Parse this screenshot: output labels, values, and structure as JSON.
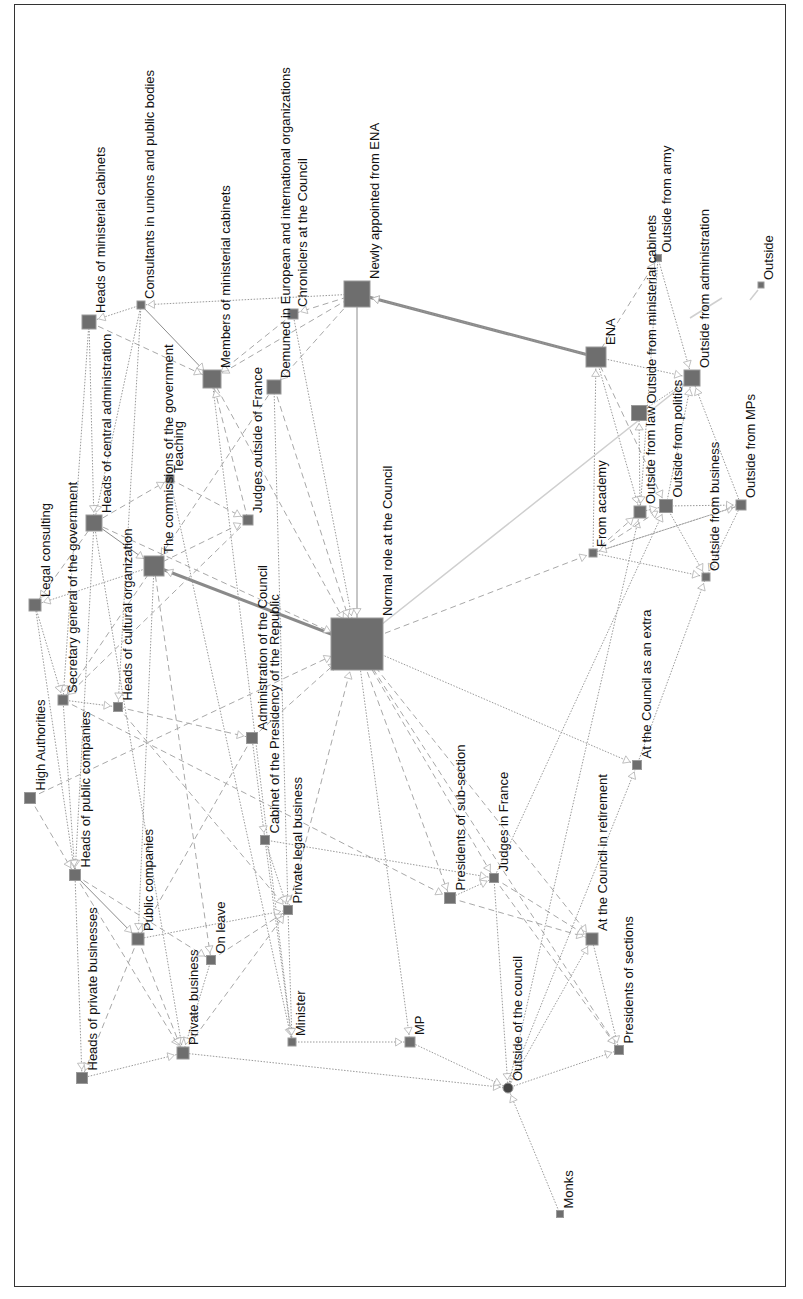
{
  "diagram": {
    "type": "directed-network",
    "orientation": "rotated 90° counter-clockwise (labels read bottom-to-top)",
    "nodes": [
      {
        "id": "normal",
        "label": "Normal role at the Council",
        "x": 357,
        "y": 644,
        "size": 52,
        "shape": "square"
      },
      {
        "id": "newly_ena",
        "label": "Newly appointed from ENA",
        "x": 357,
        "y": 294,
        "size": 26,
        "shape": "square"
      },
      {
        "id": "ena",
        "label": "ENA",
        "x": 596,
        "y": 357,
        "size": 20,
        "shape": "square"
      },
      {
        "id": "chroniclers",
        "label": "Chroniclers at the Council",
        "x": 293,
        "y": 314,
        "size": 10,
        "shape": "square"
      },
      {
        "id": "demuned",
        "label": "Demuned in European and international organizations",
        "x": 274,
        "y": 387,
        "size": 14,
        "shape": "square"
      },
      {
        "id": "members_cab",
        "label": "Members of ministerial cabinets",
        "x": 212,
        "y": 379,
        "size": 18,
        "shape": "square"
      },
      {
        "id": "consultants",
        "label": "Consultants in unions and public bodies",
        "x": 141,
        "y": 305,
        "size": 8,
        "shape": "square"
      },
      {
        "id": "heads_cab",
        "label": "Heads of ministerial cabinets",
        "x": 89,
        "y": 322,
        "size": 14,
        "shape": "square"
      },
      {
        "id": "heads_central",
        "label": "Heads of central administration",
        "x": 94,
        "y": 523,
        "size": 16,
        "shape": "square"
      },
      {
        "id": "commissions",
        "label": "The commissions of the government",
        "x": 154,
        "y": 566,
        "size": 20,
        "shape": "square"
      },
      {
        "id": "teaching",
        "label": "Teaching",
        "x": 170,
        "y": 479,
        "size": 8,
        "shape": "square"
      },
      {
        "id": "judges_out",
        "label": "Judges outside of France",
        "x": 248,
        "y": 520,
        "size": 10,
        "shape": "square"
      },
      {
        "id": "legal",
        "label": "Legal consulting",
        "x": 35,
        "y": 605,
        "size": 12,
        "shape": "square"
      },
      {
        "id": "secgen",
        "label": "Secretary general of the government",
        "x": 63,
        "y": 700,
        "size": 10,
        "shape": "square"
      },
      {
        "id": "cultural",
        "label": "Heads of cultural organization",
        "x": 118,
        "y": 707,
        "size": 9,
        "shape": "square"
      },
      {
        "id": "admin_council",
        "label": "Administration of the Council",
        "x": 252,
        "y": 738,
        "size": 11,
        "shape": "square"
      },
      {
        "id": "cabinet_pres",
        "label": "Cabinet of the Presidency of the Republic",
        "x": 265,
        "y": 840,
        "size": 9,
        "shape": "square"
      },
      {
        "id": "high_auth",
        "label": "High Authorities",
        "x": 30,
        "y": 798,
        "size": 11,
        "shape": "square"
      },
      {
        "id": "heads_public",
        "label": "Heads of public companies",
        "x": 75,
        "y": 875,
        "size": 11,
        "shape": "square"
      },
      {
        "id": "public_comp",
        "label": "Public companies",
        "x": 138,
        "y": 939,
        "size": 12,
        "shape": "square"
      },
      {
        "id": "on_leave",
        "label": "On leave",
        "x": 211,
        "y": 960,
        "size": 9,
        "shape": "square"
      },
      {
        "id": "private_legal",
        "label": "Private legal business",
        "x": 288,
        "y": 910,
        "size": 9,
        "shape": "square"
      },
      {
        "id": "private_bus",
        "label": "Private business",
        "x": 183,
        "y": 1053,
        "size": 12,
        "shape": "square"
      },
      {
        "id": "heads_private",
        "label": "Heads of private businesses",
        "x": 82,
        "y": 1078,
        "size": 11,
        "shape": "square"
      },
      {
        "id": "minister",
        "label": "Minister",
        "x": 292,
        "y": 1042,
        "size": 8,
        "shape": "square"
      },
      {
        "id": "mp",
        "label": "MP",
        "x": 410,
        "y": 1042,
        "size": 10,
        "shape": "square"
      },
      {
        "id": "pres_subsec",
        "label": "Presidents of sub-section",
        "x": 450,
        "y": 898,
        "size": 11,
        "shape": "square"
      },
      {
        "id": "judges_fr",
        "label": "Judges in France",
        "x": 494,
        "y": 878,
        "size": 9,
        "shape": "square"
      },
      {
        "id": "outside_council",
        "label": "Outside of the council",
        "x": 508,
        "y": 1088,
        "size": 10,
        "shape": "circle"
      },
      {
        "id": "monks",
        "label": "Monks",
        "x": 560,
        "y": 1214,
        "size": 7,
        "shape": "square"
      },
      {
        "id": "at_council_ret",
        "label": "At the Council in retirement",
        "x": 592,
        "y": 939,
        "size": 12,
        "shape": "square"
      },
      {
        "id": "pres_sections",
        "label": "Presidents of sections",
        "x": 619,
        "y": 1050,
        "size": 9,
        "shape": "square"
      },
      {
        "id": "at_council_extra",
        "label": "At the Council as an extra",
        "x": 637,
        "y": 765,
        "size": 9,
        "shape": "square"
      },
      {
        "id": "from_academy",
        "label": "From academy",
        "x": 593,
        "y": 553,
        "size": 8,
        "shape": "square"
      },
      {
        "id": "out_law",
        "label": "Outside from law",
        "x": 640,
        "y": 512,
        "size": 12,
        "shape": "square"
      },
      {
        "id": "out_politics",
        "label": "Outside from politics",
        "x": 666,
        "y": 506,
        "size": 13,
        "shape": "square"
      },
      {
        "id": "out_business",
        "label": "Outside from business",
        "x": 706,
        "y": 577,
        "size": 8,
        "shape": "square"
      },
      {
        "id": "out_mps",
        "label": "Outside from MPs",
        "x": 741,
        "y": 505,
        "size": 10,
        "shape": "square"
      },
      {
        "id": "out_ministerial",
        "label": "Outside from ministerial cabinets",
        "x": 639,
        "y": 413,
        "size": 15,
        "shape": "square"
      },
      {
        "id": "out_admin",
        "label": "Outside from administration",
        "x": 692,
        "y": 378,
        "size": 16,
        "shape": "square"
      },
      {
        "id": "out_army",
        "label": "Outside from army",
        "x": 658,
        "y": 258,
        "size": 7,
        "shape": "square"
      },
      {
        "id": "outside",
        "label": "Outside",
        "x": 761,
        "y": 285,
        "size": 6,
        "shape": "square"
      }
    ],
    "edges": [
      {
        "from": "newly_ena",
        "to": "normal",
        "style": "solid"
      },
      {
        "from": "ena",
        "to": "newly_ena",
        "style": "thick"
      },
      {
        "from": "normal",
        "to": "commissions",
        "style": "thick"
      },
      {
        "from": "newly_ena",
        "to": "chroniclers",
        "style": "dashed"
      },
      {
        "from": "newly_ena",
        "to": "consultants",
        "style": "dotted"
      },
      {
        "from": "newly_ena",
        "to": "members_cab",
        "style": "dashed"
      },
      {
        "from": "newly_ena",
        "to": "demuned",
        "style": "dashed"
      },
      {
        "from": "chroniclers",
        "to": "normal",
        "style": "dotted"
      },
      {
        "from": "chroniclers",
        "to": "members_cab",
        "style": "dashed"
      },
      {
        "from": "consultants",
        "to": "heads_cab",
        "style": "dotted"
      },
      {
        "from": "consultants",
        "to": "members_cab",
        "style": "solid"
      },
      {
        "from": "consultants",
        "to": "heads_central",
        "style": "dotted"
      },
      {
        "from": "consultants",
        "to": "cultural",
        "style": "dotted"
      },
      {
        "from": "heads_cab",
        "to": "heads_central",
        "style": "dotted"
      },
      {
        "from": "heads_cab",
        "to": "members_cab",
        "style": "dashed"
      },
      {
        "from": "heads_cab",
        "to": "secgen",
        "style": "dotted"
      },
      {
        "from": "members_cab",
        "to": "normal",
        "style": "dashed"
      },
      {
        "from": "members_cab",
        "to": "minister",
        "style": "dotted"
      },
      {
        "from": "demuned",
        "to": "normal",
        "style": "dashed"
      },
      {
        "from": "demuned",
        "to": "commissions",
        "style": "dashed"
      },
      {
        "from": "demuned",
        "to": "private_legal",
        "style": "dotted"
      },
      {
        "from": "heads_central",
        "to": "commissions",
        "style": "solid"
      },
      {
        "from": "heads_central",
        "to": "legal",
        "style": "dashed"
      },
      {
        "from": "heads_central",
        "to": "normal",
        "style": "dashed"
      },
      {
        "from": "heads_central",
        "to": "heads_public",
        "style": "dotted"
      },
      {
        "from": "heads_central",
        "to": "private_bus",
        "style": "dotted"
      },
      {
        "from": "heads_central",
        "to": "teaching",
        "style": "dashed"
      },
      {
        "from": "commissions",
        "to": "legal",
        "style": "dotted"
      },
      {
        "from": "commissions",
        "to": "judges_out",
        "style": "dashed"
      },
      {
        "from": "commissions",
        "to": "public_comp",
        "style": "dotted"
      },
      {
        "from": "commissions",
        "to": "on_leave",
        "style": "dashed"
      },
      {
        "from": "commissions",
        "to": "secgen",
        "style": "dashed"
      },
      {
        "from": "teaching",
        "to": "judges_out",
        "style": "dashed"
      },
      {
        "from": "teaching",
        "to": "minister",
        "style": "dotted"
      },
      {
        "from": "judges_out",
        "to": "secgen",
        "style": "dashed"
      },
      {
        "from": "judges_out",
        "to": "members_cab",
        "style": "dashed"
      },
      {
        "from": "legal",
        "to": "secgen",
        "style": "dotted"
      },
      {
        "from": "legal",
        "to": "heads_public",
        "style": "dotted"
      },
      {
        "from": "secgen",
        "to": "cultural",
        "style": "dotted"
      },
      {
        "from": "secgen",
        "to": "heads_public",
        "style": "dotted"
      },
      {
        "from": "secgen",
        "to": "pres_subsec",
        "style": "dashed"
      },
      {
        "from": "cultural",
        "to": "admin_council",
        "style": "dashed"
      },
      {
        "from": "cultural",
        "to": "private_legal",
        "style": "dashed"
      },
      {
        "from": "admin_council",
        "to": "normal",
        "style": "dashed"
      },
      {
        "from": "admin_council",
        "to": "cabinet_pres",
        "style": "dotted"
      },
      {
        "from": "admin_council",
        "to": "public_comp",
        "style": "dashed"
      },
      {
        "from": "high_auth",
        "to": "normal",
        "style": "dashed"
      },
      {
        "from": "high_auth",
        "to": "heads_public",
        "style": "dashed"
      },
      {
        "from": "heads_public",
        "to": "public_comp",
        "style": "solid"
      },
      {
        "from": "heads_public",
        "to": "heads_private",
        "style": "dotted"
      },
      {
        "from": "heads_public",
        "to": "private_bus",
        "style": "dashed"
      },
      {
        "from": "heads_public",
        "to": "on_leave",
        "style": "dashed"
      },
      {
        "from": "cabinet_pres",
        "to": "judges_fr",
        "style": "dotted"
      },
      {
        "from": "cabinet_pres",
        "to": "private_legal",
        "style": "dotted"
      },
      {
        "from": "cabinet_pres",
        "to": "minister",
        "style": "dotted"
      },
      {
        "from": "public_comp",
        "to": "private_legal",
        "style": "dotted"
      },
      {
        "from": "public_comp",
        "to": "heads_private",
        "style": "dashed"
      },
      {
        "from": "public_comp",
        "to": "private_bus",
        "style": "dashed"
      },
      {
        "from": "on_leave",
        "to": "private_legal",
        "style": "dashed"
      },
      {
        "from": "on_leave",
        "to": "private_bus",
        "style": "dotted"
      },
      {
        "from": "private_legal",
        "to": "normal",
        "style": "dashed"
      },
      {
        "from": "private_legal",
        "to": "minister",
        "style": "dotted"
      },
      {
        "from": "private_bus",
        "to": "private_legal",
        "style": "dashed"
      },
      {
        "from": "private_bus",
        "to": "outside_council",
        "style": "dotted"
      },
      {
        "from": "heads_private",
        "to": "private_bus",
        "style": "dotted"
      },
      {
        "from": "minister",
        "to": "mp",
        "style": "dotted"
      },
      {
        "from": "mp",
        "to": "outside_council",
        "style": "dotted"
      },
      {
        "from": "normal",
        "to": "mp",
        "style": "dotted"
      },
      {
        "from": "normal",
        "to": "pres_subsec",
        "style": "dashed"
      },
      {
        "from": "normal",
        "to": "judges_fr",
        "style": "dashed"
      },
      {
        "from": "normal",
        "to": "at_council_extra",
        "style": "dotted"
      },
      {
        "from": "normal",
        "to": "pres_sections",
        "style": "dashed"
      },
      {
        "from": "normal",
        "to": "at_council_ret",
        "style": "dashed"
      },
      {
        "from": "normal",
        "to": "from_academy",
        "style": "dashed"
      },
      {
        "from": "pres_subsec",
        "to": "judges_fr",
        "style": "dotted"
      },
      {
        "from": "pres_subsec",
        "to": "at_council_ret",
        "style": "dashed"
      },
      {
        "from": "judges_fr",
        "to": "outside_council",
        "style": "dotted"
      },
      {
        "from": "judges_fr",
        "to": "at_council_ret",
        "style": "dashed"
      },
      {
        "from": "judges_fr",
        "to": "pres_sections",
        "style": "dashed"
      },
      {
        "from": "judges_fr",
        "to": "out_politics",
        "style": "dotted"
      },
      {
        "from": "outside_council",
        "to": "at_council_ret",
        "style": "dotted"
      },
      {
        "from": "outside_council",
        "to": "pres_sections",
        "style": "dotted"
      },
      {
        "from": "outside_council",
        "to": "at_council_extra",
        "style": "dotted"
      },
      {
        "from": "outside_council",
        "to": "out_law",
        "style": "dotted"
      },
      {
        "from": "monks",
        "to": "outside_council",
        "style": "dotted"
      },
      {
        "from": "at_council_ret",
        "to": "pres_sections",
        "style": "dotted"
      },
      {
        "from": "at_council_extra",
        "to": "out_business",
        "style": "dotted"
      },
      {
        "from": "from_academy",
        "to": "ena",
        "style": "dotted"
      },
      {
        "from": "from_academy",
        "to": "out_law",
        "style": "dashed"
      },
      {
        "from": "from_academy",
        "to": "out_politics",
        "style": "dashed"
      },
      {
        "from": "from_academy",
        "to": "out_business",
        "style": "dotted"
      },
      {
        "from": "from_academy",
        "to": "out_mps",
        "style": "dotted"
      },
      {
        "from": "ena",
        "to": "out_law",
        "style": "dotted"
      },
      {
        "from": "ena",
        "to": "out_politics",
        "style": "dashed"
      },
      {
        "from": "ena",
        "to": "out_admin",
        "style": "dotted"
      },
      {
        "from": "ena",
        "to": "out_army",
        "style": "dashed"
      },
      {
        "from": "out_law",
        "to": "out_politics",
        "style": "dotted"
      },
      {
        "from": "out_law",
        "to": "out_ministerial",
        "style": "dotted"
      },
      {
        "from": "out_politics",
        "to": "out_mps",
        "style": "dotted"
      },
      {
        "from": "out_politics",
        "to": "out_admin",
        "style": "dotted"
      },
      {
        "from": "out_politics",
        "to": "out_business",
        "style": "dotted"
      },
      {
        "from": "out_mps",
        "to": "out_admin",
        "style": "dotted"
      },
      {
        "from": "out_mps",
        "to": "out_business",
        "style": "dotted"
      },
      {
        "from": "out_army",
        "to": "out_admin",
        "style": "dotted"
      },
      {
        "from": "out_army",
        "to": "out_law",
        "style": "dotted"
      },
      {
        "from": "out_ministerial",
        "to": "out_admin",
        "style": "dotted"
      },
      {
        "from": "out_mps",
        "to": "from_academy",
        "style": "dotted"
      },
      {
        "from": "ena",
        "to": "newly_ena",
        "style": "dotted"
      },
      {
        "from": "normal",
        "to": "out_admin",
        "style": "light"
      }
    ],
    "stray_marks": [
      {
        "x1": 750,
        "y1": 300,
        "x2": 758,
        "y2": 290,
        "style": "light"
      },
      {
        "x1": 690,
        "y1": 318,
        "x2": 722,
        "y2": 298,
        "style": "light"
      }
    ]
  }
}
